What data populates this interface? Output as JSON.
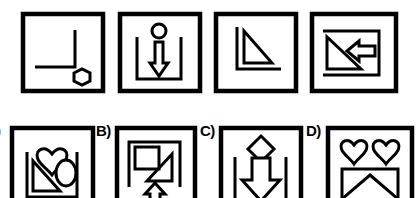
{
  "puzzle": {
    "type": "abstract-reasoning-matrix",
    "colors": {
      "ink": "#000000",
      "background": "#ffffff"
    },
    "sequence_row": {
      "label": "",
      "panels": [
        {
          "id": "panel-1",
          "position": 1,
          "frame": "square-border",
          "shapes": [
            "corner-bracket-L",
            "hexagon"
          ],
          "description": "L-shaped corner line with a small hexagon at lower right"
        },
        {
          "id": "panel-2",
          "position": 2,
          "frame": "square-border",
          "shapes": [
            "u-bracket",
            "circle",
            "down-arrow"
          ],
          "description": "U-shaped bracket containing a thin down arrow, small circle above"
        },
        {
          "id": "panel-3",
          "position": 3,
          "frame": "square-border",
          "shapes": [
            "corner-bracket-L",
            "right-triangle"
          ],
          "description": "L-shaped corner line with a right triangle inside"
        },
        {
          "id": "panel-4",
          "position": 4,
          "frame": "square-border",
          "shapes": [
            "bracket-right",
            "right-triangle",
            "left-arrow"
          ],
          "description": "Reversed bracket with a right triangle and a left pointing arrow"
        }
      ]
    },
    "options_row": {
      "options": [
        {
          "id": "option-a",
          "label": ")",
          "full_label": "A)",
          "clipped": true,
          "frame": "square-border",
          "shapes": [
            "u-bracket",
            "heart",
            "right-triangle",
            "ellipse"
          ],
          "description": "U bracket with heart above, right triangle and ellipse inside"
        },
        {
          "id": "option-b",
          "label": "B)",
          "full_label": "B)",
          "clipped": false,
          "frame": "square-border",
          "shapes": [
            "inverted-u-bracket",
            "square",
            "right-triangle",
            "up-arrow"
          ],
          "description": "Inverted U bracket with square and triangle inside, up arrow below"
        },
        {
          "id": "option-c",
          "label": "C)",
          "full_label": "C)",
          "clipped": false,
          "frame": "square-border",
          "shapes": [
            "u-bracket",
            "diamond",
            "down-arrow"
          ],
          "description": "U bracket with diamond above and a large down arrow inside"
        },
        {
          "id": "option-d",
          "label": "D)",
          "full_label": "D)",
          "clipped": false,
          "frame": "square-border",
          "shapes": [
            "heart",
            "heart",
            "rectangle",
            "diamond"
          ],
          "description": "Two hearts above a rectangle containing a diamond"
        }
      ]
    }
  }
}
